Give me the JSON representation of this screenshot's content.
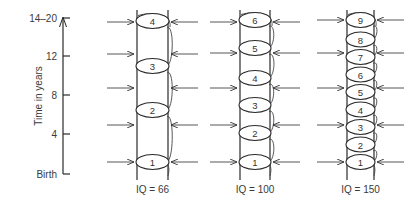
{
  "axis": {
    "title": "Time in years",
    "ticks": [
      {
        "label": "14–20",
        "y": 18
      },
      {
        "label": "12",
        "y": 56
      },
      {
        "label": "8",
        "y": 95
      },
      {
        "label": "4",
        "y": 134
      },
      {
        "label": "Birth",
        "y": 174
      }
    ]
  },
  "columns": [
    {
      "label": "IQ = 66",
      "left_x": 137,
      "right_x": 168,
      "stages": [
        "1",
        "2",
        "3",
        "4"
      ],
      "stage_y": [
        162,
        110,
        66,
        21
      ],
      "arrow_y": [
        162,
        125,
        88,
        54,
        22
      ]
    },
    {
      "label": "IQ = 100",
      "left_x": 240,
      "right_x": 270,
      "stages": [
        "1",
        "2",
        "3",
        "4",
        "5",
        "6"
      ],
      "stage_y": [
        162,
        133,
        105,
        78,
        48,
        20
      ],
      "arrow_y": [
        162,
        125,
        88,
        53,
        22
      ]
    },
    {
      "label": "IQ = 150",
      "left_x": 347,
      "right_x": 374,
      "stages": [
        "1",
        "2",
        "3",
        "4",
        "5",
        "6",
        "7",
        "8",
        "9"
      ],
      "stage_y": [
        162,
        144.5,
        127,
        109.5,
        92,
        74.5,
        57,
        39.5,
        20
      ],
      "arrow_y": [
        162,
        125,
        88,
        53,
        20
      ]
    }
  ],
  "colors": {
    "ink": "#2a2a2a",
    "background": "#ffffff"
  }
}
